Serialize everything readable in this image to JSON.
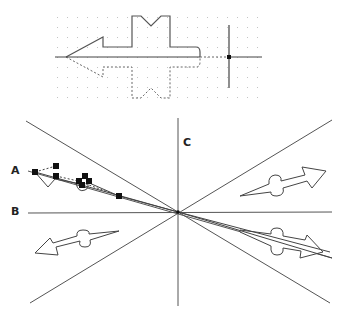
{
  "top_panel": {
    "description": "Mirrored arrow shape on dotted grid with pivot cross-hair"
  },
  "bottom_panel": {
    "center": [
      178,
      212
    ],
    "labels": {
      "a": "A",
      "b": "B",
      "c": "C"
    },
    "arrows": [
      {
        "name": "upper-left-selected-arrow",
        "direction": "left",
        "selected": true
      },
      {
        "name": "upper-right-arrow",
        "direction": "right"
      },
      {
        "name": "lower-left-arrow",
        "direction": "left"
      },
      {
        "name": "lower-right-arrow",
        "direction": "right"
      }
    ]
  },
  "colors": {
    "line": "#3a3a3a",
    "grid_dot": "#bdbdbd",
    "handle": "#111111"
  }
}
